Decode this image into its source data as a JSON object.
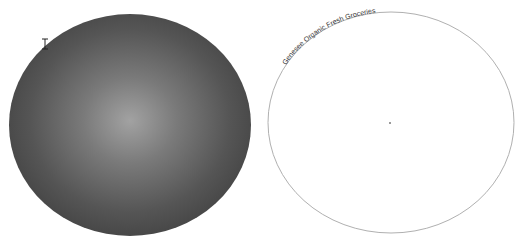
{
  "canvas": {
    "background": "#ffffff"
  },
  "left_shape": {
    "type": "ellipse",
    "fill_gradient": {
      "type": "radial",
      "center_color": "#a0a0a0",
      "edge_color": "#454545"
    },
    "cursor": "text-cursor-icon"
  },
  "right_shape": {
    "type": "ellipse",
    "stroke_color": "#b0b0b0",
    "fill": "#ffffff",
    "path_text": "Genesee Organic Fresh Groceries",
    "center_marker": "dot"
  }
}
